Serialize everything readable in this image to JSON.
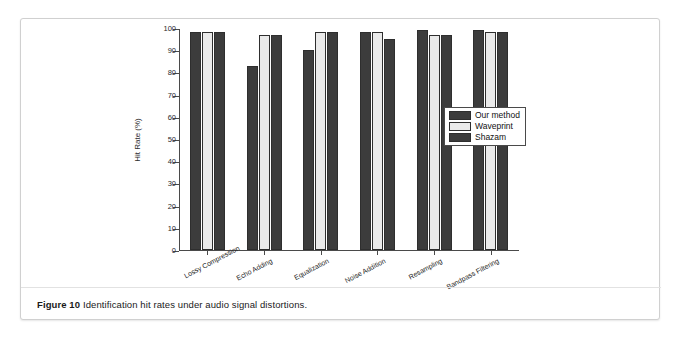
{
  "figure": {
    "caption_label": "Figure 10",
    "caption_text": "Identification hit rates under audio signal distortions."
  },
  "chart_data": {
    "type": "bar",
    "title": "",
    "xlabel": "",
    "ylabel": "Hit Rate (%)",
    "ylim": [
      0,
      100
    ],
    "ytick_labels": [
      "0",
      "10",
      "20",
      "30",
      "40",
      "50",
      "60",
      "70",
      "80",
      "90",
      "100"
    ],
    "ytick_values": [
      0,
      10,
      20,
      30,
      40,
      50,
      60,
      70,
      80,
      90,
      100
    ],
    "grid": false,
    "legend_position": "center-right",
    "categories": [
      "Lossy Compression",
      "Echo Adding",
      "Equalization",
      "Noise Addition",
      "Resampling",
      "Bandpass Filtering"
    ],
    "series": [
      {
        "name": "Our method",
        "color": "#3c3c3c",
        "values": [
          98,
          83,
          90,
          98,
          99,
          99
        ]
      },
      {
        "name": "Waveprint",
        "color": "#eaeaea",
        "values": [
          98,
          97,
          98,
          98,
          97,
          98
        ]
      },
      {
        "name": "Shazam",
        "color": "#3c3c3c",
        "values": [
          98,
          97,
          98,
          95,
          97,
          98
        ]
      }
    ]
  }
}
